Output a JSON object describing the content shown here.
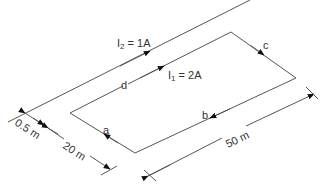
{
  "diagram": {
    "wire_current": {
      "symbol": "I",
      "sub": "2",
      "rest": " = 1A"
    },
    "loop_current": {
      "symbol": "I",
      "sub": "1",
      "rest": " = 2A"
    },
    "sides": {
      "a": "a",
      "b": "b",
      "c": "c",
      "d": "d"
    },
    "dimensions": {
      "separation": "0.5 m",
      "width": "20 m",
      "length": "50 m"
    },
    "colors": {
      "line": "#555555",
      "arrow": "#111111",
      "text": "#333333"
    }
  }
}
